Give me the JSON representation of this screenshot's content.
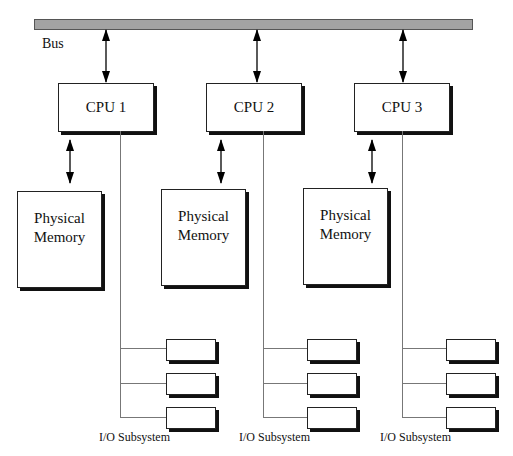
{
  "diagram": {
    "bus": {
      "label": "Bus",
      "color": "#a3a3a3"
    },
    "nodes": [
      {
        "cpu": {
          "label": "CPU 1"
        },
        "memory": {
          "line1": "Physical",
          "line2": "Memory"
        },
        "io": {
          "label": "I/O Subsystem",
          "device_count": 3
        }
      },
      {
        "cpu": {
          "label": "CPU 2"
        },
        "memory": {
          "line1": "Physical",
          "line2": "Memory"
        },
        "io": {
          "label": "I/O Subsystem",
          "device_count": 3
        }
      },
      {
        "cpu": {
          "label": "CPU 3"
        },
        "memory": {
          "line1": "Physical",
          "line2": "Memory"
        },
        "io": {
          "label": "I/O Subsystem",
          "device_count": 3
        }
      }
    ],
    "connections": [
      "Bus <-> CPU 1",
      "Bus <-> CPU 2",
      "Bus <-> CPU 3",
      "CPU 1 <-> Physical Memory",
      "CPU 2 <-> Physical Memory",
      "CPU 3 <-> Physical Memory",
      "CPU 1 -> I/O Subsystem",
      "CPU 2 -> I/O Subsystem",
      "CPU 3 -> I/O Subsystem"
    ]
  }
}
